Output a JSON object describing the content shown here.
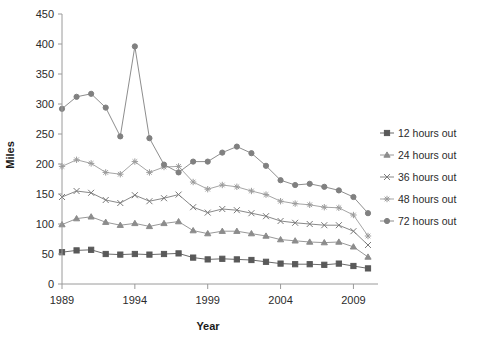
{
  "chart_data": {
    "type": "line",
    "title": "",
    "xlabel": "Year",
    "ylabel": "Miles",
    "xlim": [
      1989,
      2010
    ],
    "ylim": [
      0,
      450
    ],
    "ytick_step": 50,
    "yticks": [
      0,
      50,
      100,
      150,
      200,
      250,
      300,
      350,
      400,
      450
    ],
    "xticks": [
      1989,
      1994,
      1999,
      2004,
      2009
    ],
    "xticklabels": [
      "1989",
      "1994",
      "1999",
      "2004",
      "2009"
    ],
    "grid": false,
    "legend_position": "right",
    "x": [
      1989,
      1990,
      1991,
      1992,
      1993,
      1994,
      1995,
      1996,
      1997,
      1998,
      1999,
      2000,
      2001,
      2002,
      2003,
      2004,
      2005,
      2006,
      2007,
      2008,
      2009,
      2010
    ],
    "series": [
      {
        "name": "12 hours out",
        "marker": "square",
        "color": "#595959",
        "values": [
          53,
          56,
          57,
          50,
          49,
          50,
          49,
          50,
          51,
          44,
          41,
          42,
          41,
          40,
          37,
          34,
          33,
          33,
          32,
          34,
          30,
          26
        ]
      },
      {
        "name": "24 hours out",
        "marker": "triangle",
        "color": "#8c8c8c",
        "values": [
          99,
          109,
          112,
          103,
          98,
          101,
          96,
          101,
          104,
          89,
          84,
          88,
          88,
          84,
          80,
          74,
          72,
          70,
          69,
          70,
          62,
          45
        ]
      },
      {
        "name": "36 hours out",
        "marker": "cross",
        "color": "#7a7a7a",
        "values": [
          145,
          155,
          152,
          140,
          135,
          148,
          138,
          143,
          149,
          128,
          119,
          125,
          123,
          118,
          113,
          105,
          102,
          100,
          98,
          98,
          88,
          65
        ]
      },
      {
        "name": "48 hours out",
        "marker": "asterisk",
        "color": "#9b9b9b",
        "values": [
          196,
          207,
          201,
          186,
          183,
          204,
          186,
          195,
          196,
          170,
          158,
          165,
          162,
          155,
          149,
          138,
          134,
          132,
          128,
          127,
          115,
          80
        ]
      },
      {
        "name": "72 hours out",
        "marker": "circle",
        "color": "#808080",
        "values": [
          292,
          312,
          317,
          294,
          246,
          396,
          243,
          199,
          186,
          204,
          204,
          219,
          229,
          218,
          197,
          173,
          165,
          167,
          162,
          156,
          145,
          118
        ]
      }
    ]
  },
  "legend": {
    "items": [
      {
        "label": "12 hours out"
      },
      {
        "label": "24 hours out"
      },
      {
        "label": "36 hours out"
      },
      {
        "label": "48 hours out"
      },
      {
        "label": "72 hours out"
      }
    ]
  }
}
